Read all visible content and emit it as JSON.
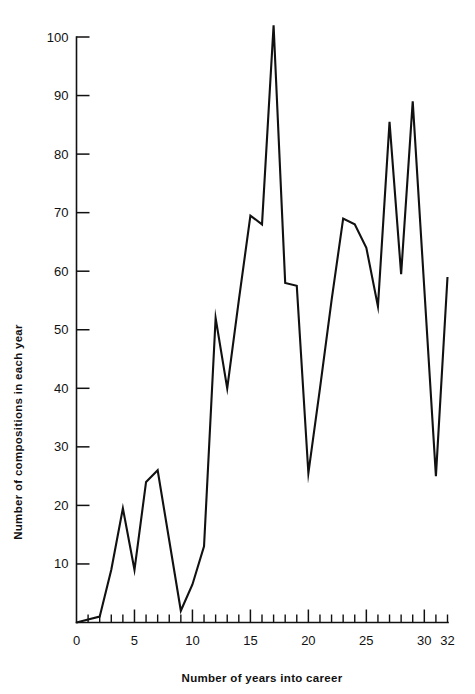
{
  "chart_data": {
    "type": "line",
    "title": "",
    "xlabel": "Number of years into career",
    "ylabel": "Number of compositions in each year",
    "xlim": [
      0,
      32
    ],
    "ylim": [
      0,
      100
    ],
    "grid": false,
    "legend": "none",
    "line_color": "#111111",
    "x_major_ticks": [
      0,
      5,
      10,
      15,
      20,
      25,
      30,
      32
    ],
    "x_major_tick_labels": [
      "0",
      "5",
      "10",
      "15",
      "20",
      "25",
      "30",
      "32"
    ],
    "x_minor_tick_step": 1,
    "y_major_ticks": [
      10,
      20,
      30,
      40,
      50,
      60,
      70,
      80,
      90,
      100
    ],
    "y_major_tick_labels": [
      "10",
      "20",
      "30",
      "40",
      "50",
      "60",
      "70",
      "80",
      "90",
      "100"
    ],
    "x": [
      0,
      1,
      2,
      3,
      4,
      5,
      6,
      7,
      8,
      9,
      10,
      11,
      12,
      13,
      14,
      15,
      16,
      17,
      18,
      19,
      20,
      21,
      22,
      23,
      24,
      25,
      26,
      27,
      28,
      29,
      30,
      31,
      32
    ],
    "values": [
      0,
      0.5,
      1,
      9,
      19.5,
      9,
      24,
      26,
      14,
      2,
      6.5,
      13,
      52,
      40,
      55,
      69.5,
      68,
      102,
      58,
      57.5,
      25.5,
      40,
      55,
      69,
      68,
      64,
      54,
      85.5,
      59.5,
      89,
      57,
      25,
      59
    ],
    "series": [
      {
        "name": "Number of compositions in each year",
        "values": [
          0,
          0.5,
          1,
          9,
          19.5,
          9,
          24,
          26,
          14,
          2,
          6.5,
          13,
          52,
          40,
          55,
          69.5,
          68,
          102,
          58,
          57.5,
          25.5,
          40,
          55,
          69,
          68,
          64,
          54,
          85.5,
          59.5,
          89,
          57,
          25,
          59
        ]
      }
    ]
  }
}
